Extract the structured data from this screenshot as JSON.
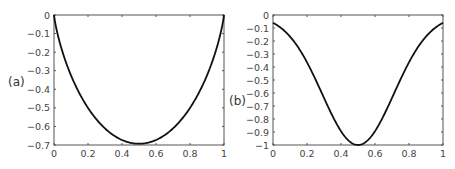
{
  "chart_data": [
    {
      "type": "line",
      "panel_label": "(a)",
      "title": "",
      "xlabel": "",
      "ylabel": "",
      "xlim": [
        0,
        1
      ],
      "ylim": [
        -0.7,
        0
      ],
      "x_ticks": [
        "0",
        "0.2",
        "0.4",
        "0.6",
        "0.8",
        "1"
      ],
      "y_ticks": [
        "0",
        "-0.1",
        "-0.2",
        "-0.3",
        "-0.4",
        "-0.5",
        "-0.6",
        "-0.7"
      ],
      "grid": false,
      "legend": null,
      "series": [
        {
          "name": "curve-a",
          "description": "x ln x + (1-x) ln(1-x)",
          "x": [
            0,
            0.05,
            0.1,
            0.15,
            0.2,
            0.25,
            0.3,
            0.35,
            0.4,
            0.45,
            0.5,
            0.55,
            0.6,
            0.65,
            0.7,
            0.75,
            0.8,
            0.85,
            0.9,
            0.95,
            1
          ],
          "values": [
            0,
            -0.199,
            -0.325,
            -0.423,
            -0.5,
            -0.562,
            -0.611,
            -0.647,
            -0.673,
            -0.688,
            -0.693,
            -0.688,
            -0.673,
            -0.647,
            -0.611,
            -0.562,
            -0.5,
            -0.423,
            -0.325,
            -0.199,
            0
          ]
        }
      ]
    },
    {
      "type": "line",
      "panel_label": "(b)",
      "title": "",
      "xlabel": "",
      "ylabel": "",
      "xlim": [
        0,
        1
      ],
      "ylim": [
        -1,
        0
      ],
      "x_ticks": [
        "0",
        "0.2",
        "0.4",
        "0.6",
        "0.8",
        "1"
      ],
      "y_ticks": [
        "0",
        "-0.1",
        "-0.2",
        "-0.3",
        "-0.4",
        "-0.5",
        "-0.6",
        "-0.7",
        "-0.8",
        "-0.9",
        "-1"
      ],
      "grid": false,
      "legend": null,
      "series": [
        {
          "name": "curve-b",
          "description": "-exp(-(x-0.5)^2 / (2*0.211^2))",
          "x": [
            0,
            0.05,
            0.1,
            0.15,
            0.2,
            0.25,
            0.3,
            0.35,
            0.4,
            0.45,
            0.5,
            0.55,
            0.6,
            0.65,
            0.7,
            0.75,
            0.8,
            0.85,
            0.9,
            0.95,
            1
          ],
          "values": [
            -0.06,
            -0.103,
            -0.166,
            -0.252,
            -0.363,
            -0.495,
            -0.638,
            -0.777,
            -0.894,
            -0.972,
            -1.0,
            -0.972,
            -0.894,
            -0.777,
            -0.638,
            -0.495,
            -0.363,
            -0.252,
            -0.166,
            -0.103,
            -0.06
          ]
        }
      ]
    }
  ]
}
